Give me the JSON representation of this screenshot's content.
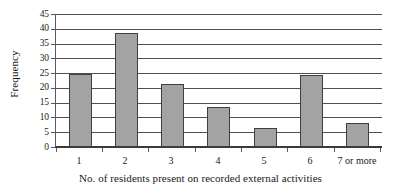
{
  "chart_data": {
    "type": "bar",
    "title": "",
    "subtitle": "",
    "xlabel": "No. of residents present on recorded external activities",
    "ylabel": "Frequency",
    "categories": [
      "1",
      "2",
      "3",
      "4",
      "5",
      "6",
      "7 or more"
    ],
    "values": [
      25,
      39,
      21.5,
      13.5,
      6.5,
      24.5,
      8.2
    ],
    "series": [
      {
        "name": "Frequency",
        "values": [
          25,
          39,
          21.5,
          13.5,
          6.5,
          24.5,
          8.2
        ]
      }
    ],
    "ylim": [
      0,
      45
    ],
    "ytick_step": 5,
    "yticks": [
      0,
      5,
      10,
      15,
      20,
      25,
      30,
      35,
      40,
      45
    ],
    "ytick_labels": [
      "0",
      "5",
      "10",
      "15",
      "20",
      "25",
      "30",
      "35",
      "40",
      "45"
    ],
    "grid": "horizontal",
    "legend": "none",
    "annotations": [],
    "colors": {
      "bar_fill": "#a3a3a3",
      "bar_border": "#3f3f3f",
      "gridline": "#4f4f4f",
      "axis": "#3a3a3a",
      "background": "#ffffff",
      "text": "#1a1a1a"
    }
  }
}
